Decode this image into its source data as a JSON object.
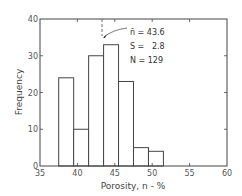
{
  "chart_data": {
    "type": "bar",
    "title": "",
    "xlabel": "Porosity, n - %",
    "ylabel": "Frequency",
    "xlim": [
      35,
      60
    ],
    "ylim": [
      0,
      40
    ],
    "x_ticks": [
      35,
      40,
      45,
      50,
      55,
      60
    ],
    "y_ticks": [
      0,
      10,
      20,
      30,
      40
    ],
    "grid": false,
    "bins": [
      {
        "left": 37.5,
        "right": 39.5,
        "value": 24
      },
      {
        "left": 39.5,
        "right": 41.5,
        "value": 10
      },
      {
        "left": 41.5,
        "right": 43.5,
        "value": 30
      },
      {
        "left": 43.5,
        "right": 45.5,
        "value": 33
      },
      {
        "left": 45.5,
        "right": 47.5,
        "value": 23
      },
      {
        "left": 47.5,
        "right": 49.5,
        "value": 5
      },
      {
        "left": 49.5,
        "right": 51.5,
        "value": 4
      }
    ],
    "categories": [
      "37.5-39.5",
      "39.5-41.5",
      "41.5-43.5",
      "43.5-45.5",
      "45.5-47.5",
      "47.5-49.5",
      "49.5-51.5"
    ],
    "values": [
      24,
      10,
      30,
      33,
      23,
      5,
      4
    ],
    "annotations": {
      "mean_line_x": 43.6,
      "stats": [
        {
          "label": "n̄",
          "eq": "=",
          "value": "43.6"
        },
        {
          "label": "S",
          "eq": "=",
          "value": "2.8"
        },
        {
          "label": "N",
          "eq": "=",
          "value": "129"
        }
      ]
    }
  },
  "labels": {
    "xlabel": "Porosity, n - %",
    "ylabel": "Frequency",
    "x_ticks": [
      "35",
      "40",
      "45",
      "50",
      "55",
      "60"
    ],
    "y_ticks": [
      "0",
      "10",
      "20",
      "30",
      "40"
    ],
    "stat_mean": "n̄ = 43.6",
    "stat_s": "S =   2.8",
    "stat_n": "N = 129"
  }
}
